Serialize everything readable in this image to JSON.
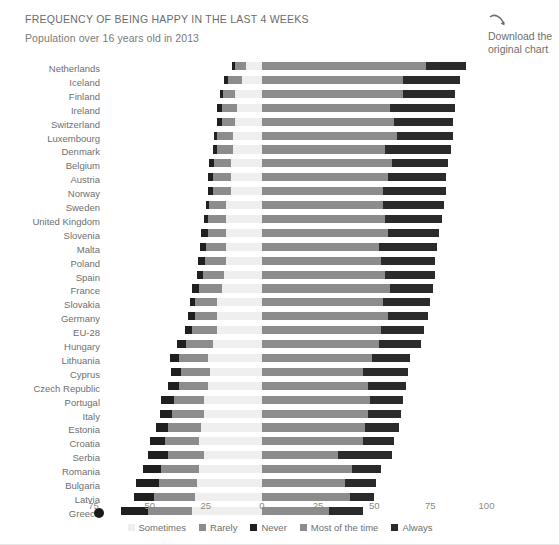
{
  "header": {
    "title": "FREQUENCY OF BEING HAPPY IN THE LAST 4 WEEKS",
    "subtitle": "Population over 16 years old in 2013",
    "download_icon": "curved-arrow-download-icon",
    "download_line1": "Download the",
    "download_line2": "original chart"
  },
  "colors": {
    "never": "#1f1f1f",
    "rarely": "#8c8c8c",
    "sometimes": "#efefef",
    "most_of_the_time": "#8c8c8c",
    "always": "#2b2b2b",
    "text": "#6f6f6f",
    "background": "#ffffff"
  },
  "marker": {
    "greece_dot": "greece-highlight-dot"
  },
  "chart_data": {
    "type": "bar",
    "orientation": "horizontal",
    "stacked": true,
    "diverging": true,
    "title": "FREQUENCY OF BEING HAPPY IN THE LAST 4 WEEKS",
    "subtitle": "Population over 16 years old in 2013",
    "xlabel": "",
    "ylabel": "",
    "xlim": [
      -87,
      100
    ],
    "xticks": [
      -75,
      -50,
      -25,
      0,
      25,
      50,
      75,
      100
    ],
    "xticklabels": [
      "75",
      "50",
      "25",
      "0",
      "25",
      "50",
      "75",
      "100"
    ],
    "grid": false,
    "legend_position": "bottom",
    "legend": [
      "Sometimes",
      "Rarely",
      "Never",
      "Most of the time",
      "Always"
    ],
    "negative_series_order": [
      "Never",
      "Rarely",
      "Sometimes"
    ],
    "positive_series_order": [
      "Most of the time",
      "Always"
    ],
    "categories": [
      "Netherlands",
      "Iceland",
      "Finland",
      "Ireland",
      "Switzerland",
      "Luxembourg",
      "Denmark",
      "Belgium",
      "Austria",
      "Norway",
      "Sweden",
      "United Kingdom",
      "Slovenia",
      "Malta",
      "Poland",
      "Spain",
      "France",
      "Slovakia",
      "Germany",
      "EU-28",
      "Hungary",
      "Lithuania",
      "Cyprus",
      "Czech Republic",
      "Portugal",
      "Italy",
      "Estonia",
      "Croatia",
      "Serbia",
      "Romania",
      "Bulgaria",
      "Latvia",
      "Greece"
    ],
    "series": [
      {
        "name": "Never",
        "values": [
          1.5,
          2.0,
          1.0,
          2.0,
          2.0,
          1.5,
          2.0,
          2.0,
          2.0,
          2.0,
          1.5,
          2.0,
          3.0,
          2.5,
          3.0,
          2.5,
          3.0,
          2.0,
          3.0,
          3.5,
          4.0,
          4.0,
          4.5,
          5.0,
          6.0,
          5.5,
          5.0,
          7.0,
          9.0,
          8.0,
          10.0,
          9.0,
          12.0
        ]
      },
      {
        "name": "Rarely",
        "values": [
          5.0,
          6.0,
          5.5,
          7.0,
          6.0,
          7.0,
          7.0,
          7.5,
          8.0,
          8.0,
          7.5,
          8.0,
          8.0,
          9.0,
          9.5,
          9.5,
          10.0,
          10.0,
          10.0,
          11.0,
          12.0,
          13.0,
          13.0,
          13.0,
          13.0,
          14.0,
          15.0,
          15.0,
          16.0,
          17.0,
          17.0,
          18.0,
          20.0
        ]
      },
      {
        "name": "Sometimes",
        "values": [
          7.0,
          9.0,
          12.0,
          11.0,
          12.0,
          13.0,
          13.0,
          14.0,
          14.0,
          14.0,
          16.0,
          16.0,
          16.0,
          16.0,
          16.0,
          17.0,
          18.0,
          20.0,
          20.0,
          20.0,
          22.0,
          24.0,
          23.0,
          24.0,
          26.0,
          26.0,
          27.0,
          28.0,
          26.0,
          28.0,
          29.0,
          30.0,
          31.0
        ]
      },
      {
        "name": "Most of the time",
        "values": [
          73.0,
          63.0,
          63.0,
          57.0,
          59.0,
          60.0,
          55.0,
          58.0,
          56.0,
          54.0,
          54.0,
          55.0,
          56.0,
          52.0,
          53.0,
          55.0,
          57.0,
          54.0,
          56.0,
          53.0,
          52.0,
          49.0,
          45.0,
          47.0,
          48.0,
          47.0,
          46.0,
          45.0,
          34.0,
          40.0,
          37.0,
          39.0,
          30.0
        ]
      },
      {
        "name": "Always",
        "values": [
          18.0,
          25.0,
          23.0,
          29.0,
          26.0,
          25.0,
          29.0,
          25.0,
          26.0,
          28.0,
          27.0,
          25.0,
          23.0,
          26.0,
          24.0,
          22.0,
          19.0,
          21.0,
          18.0,
          19.0,
          19.0,
          17.0,
          20.0,
          17.0,
          15.0,
          15.0,
          15.0,
          14.0,
          24.0,
          13.0,
          14.0,
          11.0,
          15.0
        ]
      }
    ]
  }
}
